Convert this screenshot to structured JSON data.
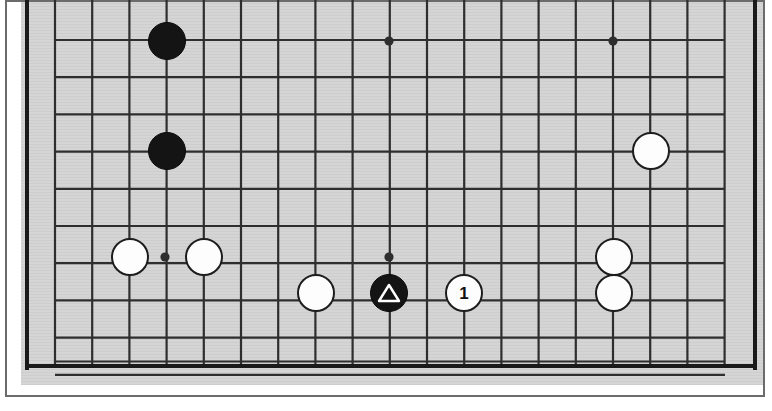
{
  "diagram": {
    "type": "go-board-diagram",
    "board_size": 19,
    "cropped": true,
    "crop_note": "Top rows of the board are cropped off the image; left, right and bottom board edges are visible.",
    "colors": {
      "board_background": "#d4d4d4",
      "grid_line": "#2e2e2e",
      "board_edge": "#1a1a1a",
      "frame_border": "#6b6b6b",
      "page_background": "#ffffff",
      "black_stone": "#141414",
      "white_stone": "#fdfdfd",
      "white_stone_outline": "#1d1d1d",
      "label_text": "#111111",
      "marker_outline": "#ffffff"
    },
    "geometry": {
      "cell_size": 37.2,
      "stone_radius": 19,
      "grid_left_x": 55,
      "grid_right_x": 725,
      "first_visible_row_y": 40,
      "bottom_edge_y": 366,
      "left_edge_x": 27,
      "right_edge_x": 755,
      "vertical_line_count": 19,
      "horizontal_line_count": 10
    },
    "star_points": [
      {
        "name": "star-point-top-left-area",
        "x": 389,
        "y": 41
      },
      {
        "name": "star-point-top-right-area",
        "x": 613,
        "y": 41
      },
      {
        "name": "star-point-lower-left",
        "x": 165,
        "y": 257
      },
      {
        "name": "star-point-lower-center",
        "x": 389,
        "y": 257
      }
    ],
    "stones": [
      {
        "id": "black-upper-left-1",
        "color": "black",
        "x": 167,
        "y": 41,
        "label": "",
        "marker": ""
      },
      {
        "id": "black-upper-left-2",
        "color": "black",
        "x": 167,
        "y": 151,
        "label": "",
        "marker": ""
      },
      {
        "id": "white-right-upper",
        "color": "white",
        "x": 651,
        "y": 151,
        "label": "",
        "marker": ""
      },
      {
        "id": "white-left-star-a",
        "color": "white",
        "x": 130,
        "y": 257,
        "label": "",
        "marker": ""
      },
      {
        "id": "white-left-star-b",
        "color": "white",
        "x": 204,
        "y": 257,
        "label": "",
        "marker": ""
      },
      {
        "id": "white-center-left",
        "color": "white",
        "x": 316,
        "y": 293,
        "label": "",
        "marker": ""
      },
      {
        "id": "black-marked",
        "color": "black",
        "x": 389,
        "y": 293,
        "label": "",
        "marker": "triangle"
      },
      {
        "id": "white-move-1",
        "color": "white",
        "x": 464,
        "y": 293,
        "label": "1",
        "marker": ""
      },
      {
        "id": "white-right-mid",
        "color": "white",
        "x": 614,
        "y": 257,
        "label": "",
        "marker": ""
      },
      {
        "id": "white-right-low",
        "color": "white",
        "x": 614,
        "y": 293,
        "label": "",
        "marker": ""
      }
    ],
    "move_labels": [
      "1"
    ],
    "markers": [
      "triangle"
    ]
  }
}
